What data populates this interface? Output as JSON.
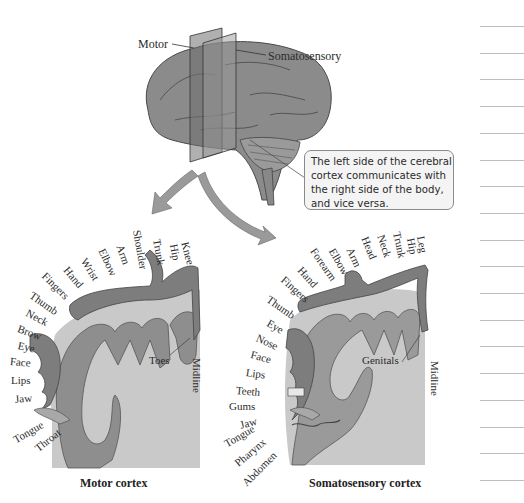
{
  "brain": {
    "plane_labels": {
      "motor": "Motor",
      "somatosensory": "Somatosensory"
    },
    "callout": "The left side of the cerebral cortex communicates with the right side of the body, and vice versa."
  },
  "motor_cortex": {
    "caption": "Motor cortex",
    "body_parts": [
      "Knee",
      "Hip",
      "Trunk",
      "Shoulder",
      "Arm",
      "Elbow",
      "Wrist",
      "Hand",
      "Fingers",
      "Thumb",
      "Neck",
      "Brow",
      "Eye",
      "Face",
      "Lips",
      "Jaw",
      "Tongue",
      "Throat"
    ],
    "inner_labels": {
      "toes": "Toes",
      "midline": "Midline"
    }
  },
  "somatosensory_cortex": {
    "caption": "Somatosensory cortex",
    "body_parts": [
      "Leg",
      "Hip",
      "Trunk",
      "Neck",
      "Head",
      "Arm",
      "Elbow",
      "Forearm",
      "Hand",
      "Fingers",
      "Thumb",
      "Eye",
      "Nose",
      "Face",
      "Lips",
      "Teeth",
      "Gums",
      "Jaw",
      "Tongue",
      "Pharynx",
      "Abdomen"
    ],
    "inner_labels": {
      "genitals": "Genitals",
      "midline": "Midline"
    }
  },
  "notes_margin": {
    "line_count": 18
  },
  "colors": {
    "cortex_fill": "#c9c9c9",
    "gyrus_fill": "#8e8e8e",
    "homunculus_fill": "#7d7d7d",
    "callout_bg": "#f4f4f4"
  }
}
